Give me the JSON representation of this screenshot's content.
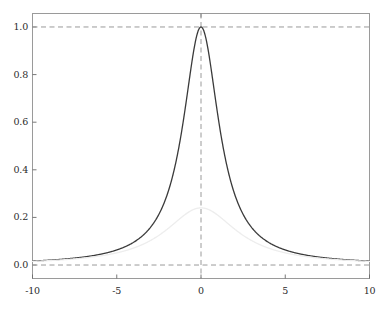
{
  "chart_data": {
    "type": "line",
    "title": "",
    "subtitle": "",
    "xlabel": "",
    "ylabel": "",
    "xlim": [
      -10,
      10
    ],
    "ylim": [
      -0.0566,
      1.0566
    ],
    "grid": false,
    "legend": null,
    "xticks": [
      -10,
      -5,
      0,
      5,
      10
    ],
    "xticklabels": [
      "-10",
      "-5",
      "0",
      "5",
      "10"
    ],
    "yticks": [
      0.0,
      0.2,
      0.4,
      0.6,
      0.8,
      1.0
    ],
    "yticklabels": [
      "0.0",
      "0.2",
      "0.4",
      "0.6",
      "0.8",
      "1.0"
    ],
    "annotations": [
      {
        "name": "reference-line-y-one",
        "type": "hline",
        "y": 1.0,
        "style": "dashed",
        "color": "#9a9a9a"
      },
      {
        "name": "reference-line-y-zero",
        "type": "hline",
        "y": 0.0,
        "style": "dashed",
        "color": "#9a9a9a"
      },
      {
        "name": "reference-line-x-zero",
        "type": "vline",
        "x": 0.0,
        "style": "dashed",
        "color": "#9a9a9a"
      }
    ],
    "series": [
      {
        "name": "main-peak",
        "color": "#3a3a3a",
        "linewidth": 1.3,
        "peak_x": 0.0,
        "peak_y": 1.0,
        "hwhm": 1.3,
        "x": [
          -10,
          -9.5,
          -9,
          -8.5,
          -8,
          -7.5,
          -7,
          -6.5,
          -6,
          -5.5,
          -5,
          -4.5,
          -4,
          -3.5,
          -3,
          -2.5,
          -2,
          -1.75,
          -1.5,
          -1.25,
          -1,
          -0.75,
          -0.5,
          -0.25,
          0,
          0.25,
          0.5,
          0.75,
          1,
          1.25,
          1.5,
          1.75,
          2,
          2.5,
          3,
          3.5,
          4,
          4.5,
          5,
          5.5,
          6,
          6.5,
          7,
          7.5,
          8,
          8.5,
          9,
          9.5,
          10
        ],
        "values": [
          0.0166,
          0.0184,
          0.0205,
          0.023,
          0.0258,
          0.0292,
          0.0332,
          0.0381,
          0.0439,
          0.0512,
          0.0602,
          0.0717,
          0.0865,
          0.106,
          0.1315,
          0.1656,
          0.2972,
          0.3558,
          0.4288,
          0.5195,
          0.6283,
          0.7505,
          0.8714,
          0.9647,
          1.0,
          0.9647,
          0.8714,
          0.7505,
          0.6283,
          0.5195,
          0.4288,
          0.3558,
          0.2972,
          0.1656,
          0.1315,
          0.106,
          0.0865,
          0.0717,
          0.0602,
          0.0512,
          0.0439,
          0.0381,
          0.0332,
          0.0292,
          0.0258,
          0.023,
          0.0205,
          0.0184,
          0.0166
        ]
      },
      {
        "name": "secondary-peak",
        "color": "#ededed",
        "linewidth": 1.3,
        "peak_x": 0.0,
        "peak_y": 0.24,
        "hwhm": 2.6,
        "x": [
          -10,
          -9.5,
          -9,
          -8.5,
          -8,
          -7.5,
          -7,
          -6.5,
          -6,
          -5.5,
          -5,
          -4.5,
          -4,
          -3.5,
          -3,
          -2.5,
          -2,
          -1.5,
          -1,
          -0.5,
          0,
          0.5,
          1,
          1.5,
          2,
          2.5,
          3,
          3.5,
          4,
          4.5,
          5,
          5.5,
          6,
          6.5,
          7,
          7.5,
          8,
          8.5,
          9,
          9.5,
          10
        ],
        "values": [
          0.0039,
          0.0043,
          0.0048,
          0.0054,
          0.0061,
          0.0069,
          0.0079,
          0.0091,
          0.0105,
          0.0123,
          0.0145,
          0.0173,
          0.021,
          0.0259,
          0.0325,
          0.042,
          0.0558,
          0.0769,
          0.1092,
          0.1572,
          0.24,
          0.1572,
          0.1092,
          0.0769,
          0.0558,
          0.042,
          0.0325,
          0.0259,
          0.021,
          0.0173,
          0.0145,
          0.0123,
          0.0105,
          0.0091,
          0.0079,
          0.0069,
          0.0061,
          0.0054,
          0.0048,
          0.0043,
          0.0039
        ]
      }
    ]
  },
  "axis": {
    "frame_color": "#9a9a9a",
    "tick_color": "#6a6a6a",
    "label_color": "#2b2b2b"
  }
}
